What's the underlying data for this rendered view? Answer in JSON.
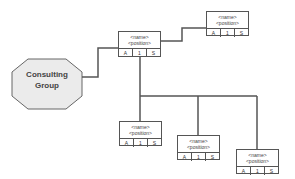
{
  "diagram": {
    "type": "org-chart",
    "root": {
      "label_line1": "Consulting",
      "label_line2": "Group",
      "shape": "octagon"
    },
    "nodes": [
      {
        "id": "manager",
        "name": "<name>",
        "position": "<position>",
        "cells": [
          "A",
          "1",
          "S"
        ]
      },
      {
        "id": "top-right",
        "name": "<name>",
        "position": "<position>",
        "cells": [
          "A",
          "1",
          "S"
        ]
      },
      {
        "id": "report-1",
        "name": "<name>",
        "position": "<position>",
        "cells": [
          "A",
          "1",
          "S"
        ]
      },
      {
        "id": "report-2",
        "name": "<name>",
        "position": "<position>",
        "cells": [
          "A",
          "1",
          "S"
        ]
      },
      {
        "id": "report-3",
        "name": "<name>",
        "position": "<position>",
        "cells": [
          "A",
          "1",
          "S"
        ]
      }
    ],
    "edges": [
      [
        "root",
        "manager"
      ],
      [
        "manager",
        "top-right"
      ],
      [
        "manager",
        "report-1"
      ],
      [
        "manager",
        "report-2"
      ],
      [
        "manager",
        "report-3"
      ]
    ],
    "colors": {
      "line": "#555555",
      "octagon_fill": "#ebebeb",
      "text": "#444444"
    }
  }
}
